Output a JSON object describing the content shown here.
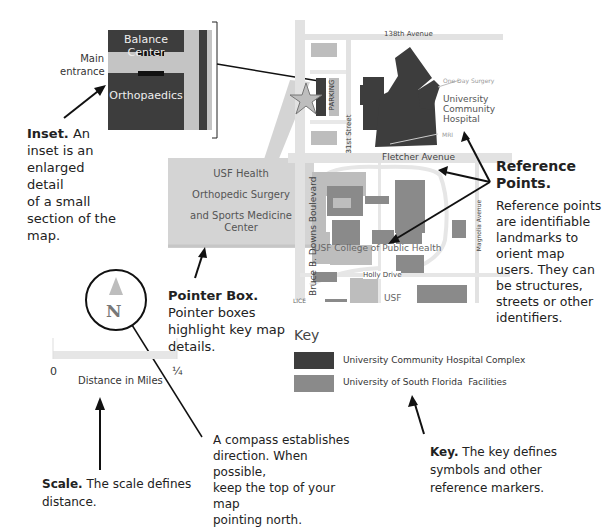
{
  "inset": {
    "labels": {
      "balance_center": "Balance Center",
      "orthopaedics": "Orthopaedics",
      "main_entrance_1": "Main",
      "main_entrance_2": "entrance"
    },
    "description_title": "Inset.",
    "description_lines": [
      "An",
      "inset is an",
      "enlarged detail",
      "of a small",
      "section of the",
      "map."
    ]
  },
  "pointer_box": {
    "lines": [
      "USF Health",
      "Orthopedic Surgery",
      "and Sports Medicine",
      "Center"
    ],
    "description_title": "Pointer Box.",
    "description_lines": [
      "Pointer boxes",
      "highlight key map",
      "details."
    ]
  },
  "map": {
    "streets": {
      "north": "138th Avenue",
      "middle": "Fletcher Avenue",
      "west": "Bruce B. Downs Boulevard",
      "local": "31st Street",
      "east": "Magnolia Avenue",
      "south": "Holly Drive"
    },
    "labels": {
      "parking": "PARKING",
      "one_day_surgery": "One Day Surgery",
      "hospital_1": "University",
      "hospital_2": "Community",
      "hospital_3": "Hospital",
      "mri": "MRI",
      "public_health": "USF College of Public Health",
      "usf": "USF",
      "cut": "LICE"
    }
  },
  "reference_points": {
    "title_1": "Reference",
    "title_2": "Points.",
    "lines": [
      "Reference points",
      "are identifiable",
      "landmarks to",
      "orient map",
      "users. They can",
      "be structures,",
      "streets or other",
      "identifiers."
    ]
  },
  "compass": {
    "letter": "N",
    "description_lines": [
      "A compass establishes",
      "direction. When possible,",
      "keep the top of your map",
      "pointing north."
    ]
  },
  "scale": {
    "start": "0",
    "end": "¼",
    "label": "Distance in Miles",
    "description_title": "Scale.",
    "description_lines": [
      "The scale defines",
      "distance."
    ]
  },
  "key": {
    "title": "Key",
    "items": [
      {
        "label": "University Community Hospital Complex",
        "color": "#3d3d3d"
      },
      {
        "label": "University of South Florida  Facilities",
        "color": "#8a8a8a"
      }
    ],
    "description_title": "Key.",
    "description_lines": [
      "The key defines",
      "symbols and other",
      "reference markers."
    ]
  },
  "colors": {
    "dark": "#3d3d3d",
    "mid": "#8a8a8a",
    "light": "#c8c8c8",
    "road": "#e2e2e2"
  }
}
